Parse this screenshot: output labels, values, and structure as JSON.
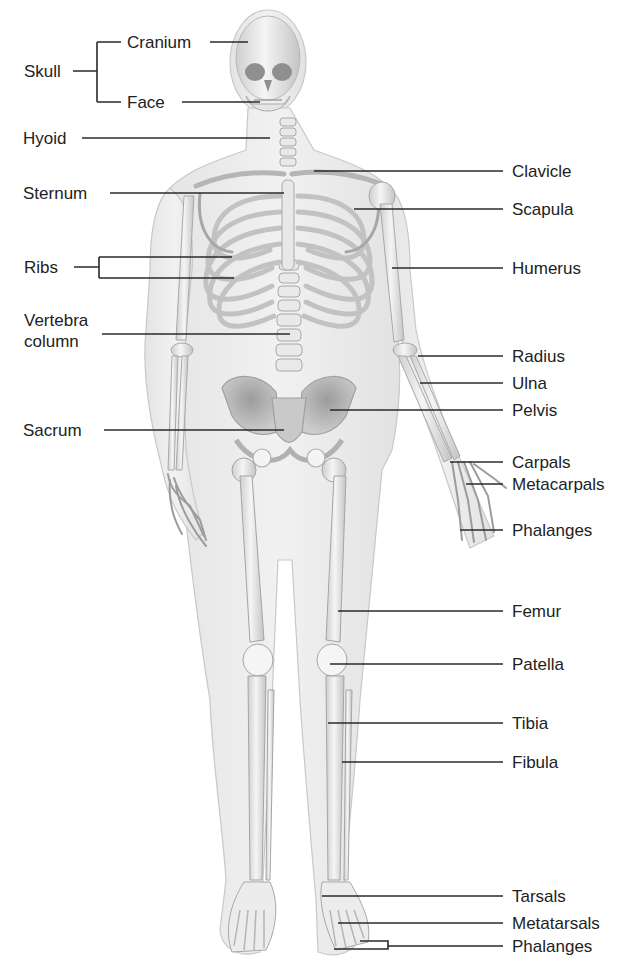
{
  "colors": {
    "background": "#ffffff",
    "skin": "#ececec",
    "skin_edge": "#c9c9c9",
    "bone": "#f3f3f3",
    "bone_shade": "#bdbdbd",
    "bone_dark": "#9a9a9a",
    "leader_line": "#2a2a2a",
    "label_text": "#222222"
  },
  "labels_left": [
    {
      "id": "skull",
      "text": "Skull",
      "group": "bracket",
      "children": [
        "cranium",
        "face"
      ]
    },
    {
      "id": "cranium",
      "text": "Cranium"
    },
    {
      "id": "face",
      "text": "Face"
    },
    {
      "id": "hyoid",
      "text": "Hyoid"
    },
    {
      "id": "sternum",
      "text": "Sternum"
    },
    {
      "id": "ribs",
      "text": "Ribs",
      "group": "bracket"
    },
    {
      "id": "vertebra-column",
      "text": "Vertebra\ncolumn",
      "lines": [
        "Vertebra",
        "column"
      ]
    },
    {
      "id": "sacrum",
      "text": "Sacrum"
    }
  ],
  "labels_right": [
    {
      "id": "clavicle",
      "text": "Clavicle"
    },
    {
      "id": "scapula",
      "text": "Scapula"
    },
    {
      "id": "humerus",
      "text": "Humerus"
    },
    {
      "id": "radius",
      "text": "Radius"
    },
    {
      "id": "ulna",
      "text": "Ulna"
    },
    {
      "id": "pelvis",
      "text": "Pelvis"
    },
    {
      "id": "carpals",
      "text": "Carpals"
    },
    {
      "id": "metacarpals",
      "text": "Metacarpals"
    },
    {
      "id": "hand-phalanges",
      "text": "Phalanges"
    },
    {
      "id": "femur",
      "text": "Femur"
    },
    {
      "id": "patella",
      "text": "Patella"
    },
    {
      "id": "tibia",
      "text": "Tibia"
    },
    {
      "id": "fibula",
      "text": "Fibula"
    },
    {
      "id": "tarsals",
      "text": "Tarsals"
    },
    {
      "id": "metatarsals",
      "text": "Metatarsals"
    },
    {
      "id": "foot-phalanges",
      "text": "Phalanges",
      "group": "bracket"
    }
  ]
}
